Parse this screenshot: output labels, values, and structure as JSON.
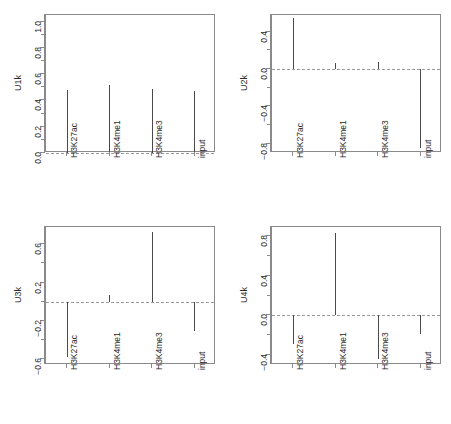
{
  "figure": {
    "type": "multi-panel-spike-plot",
    "layout": "2x2",
    "background": "#ffffff",
    "line_color": "#4a4a4a",
    "axis_color": "#8a8a8a",
    "zero_line_color": "#9a9a9a"
  },
  "chart_data": [
    {
      "type": "bar",
      "title": "",
      "xlabel": "",
      "ylabel": "U1k",
      "categories": [
        "H3K27ac",
        "H3K4me1",
        "H3K4me3",
        "input"
      ],
      "values": [
        0.48,
        0.52,
        0.49,
        0.47
      ],
      "ylim": [
        0.0,
        1.05
      ],
      "yticks": [
        0.0,
        0.2,
        0.4,
        0.6,
        0.8,
        1.0
      ],
      "ytick_labels": [
        "0.0",
        "0.2",
        "0.4",
        "0.6",
        "0.8",
        "1.0"
      ],
      "yminor": [
        0.1,
        0.3,
        0.5,
        0.7,
        0.9
      ],
      "zero_reference": 0.0,
      "grid": false,
      "legend": "none"
    },
    {
      "type": "bar",
      "title": "",
      "xlabel": "",
      "ylabel": "U2k",
      "categories": [
        "H3K27ac",
        "H3K4me1",
        "H3K4me3",
        "input"
      ],
      "values": [
        0.55,
        0.07,
        0.08,
        -0.85
      ],
      "ylim": [
        -0.9,
        0.58
      ],
      "yticks": [
        -0.8,
        -0.4,
        0.0,
        0.4
      ],
      "ytick_labels": [
        "-0.8",
        "-0.4",
        "0.0",
        "0.4"
      ],
      "yminor": [
        -0.6,
        -0.2,
        0.2
      ],
      "zero_reference": 0.0,
      "grid": false,
      "legend": "none"
    },
    {
      "type": "bar",
      "title": "",
      "xlabel": "",
      "ylabel": "U3k",
      "categories": [
        "H3K27ac",
        "H3K4me1",
        "H3K4me3",
        "input"
      ],
      "values": [
        -0.58,
        0.07,
        0.73,
        -0.3
      ],
      "ylim": [
        -0.66,
        0.78
      ],
      "yticks": [
        -0.6,
        -0.2,
        0.2,
        0.6
      ],
      "ytick_labels": [
        "-0.6",
        "-0.2",
        "0.2",
        "0.6"
      ],
      "yminor": [
        -0.4,
        0.0,
        0.4
      ],
      "zero_reference": 0.0,
      "grid": false,
      "legend": "none"
    },
    {
      "type": "bar",
      "title": "",
      "xlabel": "",
      "ylabel": "U4k",
      "categories": [
        "H3K27ac",
        "H3K4me1",
        "H3K4me3",
        "input"
      ],
      "values": [
        -0.29,
        0.83,
        -0.44,
        -0.19
      ],
      "ylim": [
        -0.5,
        0.89
      ],
      "yticks": [
        -0.4,
        0.0,
        0.4,
        0.8
      ],
      "ytick_labels": [
        "-0.4",
        "0.0",
        "0.4",
        "0.8"
      ],
      "yminor": [
        -0.2,
        0.2,
        0.6
      ],
      "zero_reference": 0.0,
      "grid": false,
      "legend": "none"
    }
  ]
}
